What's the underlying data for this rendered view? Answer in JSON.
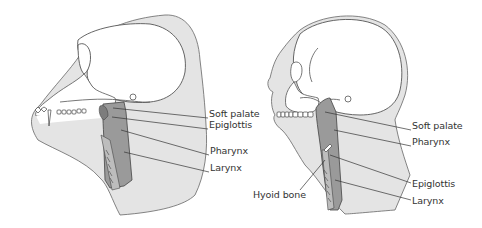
{
  "diagram": {
    "colors": {
      "background": "#ffffff",
      "skin_fill": "#e4e4e4",
      "outline": "#555555",
      "airway_fill": "#9a9a9a",
      "airway_dark": "#7d7d7d",
      "text": "#333333"
    },
    "panels": [
      {
        "id": "chimpanzee",
        "labels": [
          {
            "text": "Soft palate",
            "x": 209,
            "y": 113
          },
          {
            "text": "Epiglottis",
            "x": 209,
            "y": 124
          },
          {
            "text": "Pharynx",
            "x": 210,
            "y": 150
          },
          {
            "text": "Larynx",
            "x": 210,
            "y": 167
          }
        ]
      },
      {
        "id": "human",
        "labels": [
          {
            "text": "Soft palate",
            "x": 412,
            "y": 125
          },
          {
            "text": "Pharynx",
            "x": 412,
            "y": 141
          },
          {
            "text": "Epiglottis",
            "x": 412,
            "y": 178
          },
          {
            "text": "Larynx",
            "x": 412,
            "y": 195
          },
          {
            "text": "Hyoid bone",
            "x": 254,
            "y": 189
          }
        ]
      }
    ]
  }
}
